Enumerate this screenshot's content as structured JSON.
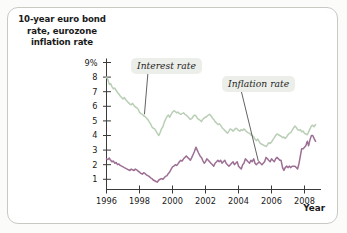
{
  "figure": {
    "title": "10-year euro bond rate, eurozone inflation rate",
    "title_line1": "10-year euro bond",
    "title_line2": "rate, eurozone",
    "title_line3": "inflation rate",
    "frame_color": "#c9c9c4",
    "background": "#ffffff"
  },
  "axes": {
    "x_axis_name": "Year",
    "y_ticks": [
      "9%",
      "8",
      "7",
      "6",
      "5",
      "4",
      "3",
      "2",
      "1"
    ],
    "x_ticks": [
      "1996",
      "1998",
      "2000",
      "2002",
      "2004",
      "2006",
      "2008"
    ]
  },
  "labels": {
    "interest": "Interest rate",
    "inflation": "Inflation rate"
  },
  "chart_data": {
    "type": "line",
    "title": "10-year euro bond rate, eurozone inflation rate",
    "xlabel": "Year",
    "ylabel": "Percent",
    "xlim": [
      1996.0,
      2009.0
    ],
    "ylim": [
      0.3,
      9.0
    ],
    "grid": false,
    "legend": "inline-annotations",
    "y_tick_values": [
      9,
      8,
      7,
      6,
      5,
      4,
      3,
      2,
      1
    ],
    "y_tick_labels": [
      "9%",
      "8",
      "7",
      "6",
      "5",
      "4",
      "3",
      "2",
      "1"
    ],
    "x_tick_values": [
      1996,
      1998,
      2000,
      2002,
      2004,
      2006,
      2008
    ],
    "x_tick_labels": [
      "1996",
      "1998",
      "2000",
      "2002",
      "2004",
      "2006",
      "2008"
    ],
    "annotations": [
      {
        "text": "Interest rate",
        "series": "10-year euro bond rate",
        "x": 1998.3,
        "y": 5.4
      },
      {
        "text": "Inflation rate",
        "series": "Eurozone inflation rate",
        "x": 2005.5,
        "y": 2.2
      }
    ],
    "series": [
      {
        "name": "10-year euro bond rate",
        "label": "Interest rate",
        "color": "#b9cfb5",
        "x": [
          1996.0,
          1996.08,
          1996.17,
          1996.25,
          1996.33,
          1996.42,
          1996.5,
          1996.58,
          1996.67,
          1996.75,
          1996.83,
          1996.92,
          1997.0,
          1997.08,
          1997.17,
          1997.25,
          1997.33,
          1997.42,
          1997.5,
          1997.58,
          1997.67,
          1997.75,
          1997.83,
          1997.92,
          1998.0,
          1998.08,
          1998.17,
          1998.25,
          1998.33,
          1998.42,
          1998.5,
          1998.58,
          1998.67,
          1998.75,
          1998.83,
          1998.92,
          1999.0,
          1999.08,
          1999.17,
          1999.25,
          1999.33,
          1999.42,
          1999.5,
          1999.58,
          1999.67,
          1999.75,
          1999.83,
          1999.92,
          2000.0,
          2000.08,
          2000.17,
          2000.25,
          2000.33,
          2000.42,
          2000.5,
          2000.58,
          2000.67,
          2000.75,
          2000.83,
          2000.92,
          2001.0,
          2001.08,
          2001.17,
          2001.25,
          2001.33,
          2001.42,
          2001.5,
          2001.58,
          2001.67,
          2001.75,
          2001.83,
          2001.92,
          2002.0,
          2002.08,
          2002.17,
          2002.25,
          2002.33,
          2002.42,
          2002.5,
          2002.58,
          2002.67,
          2002.75,
          2002.83,
          2002.92,
          2003.0,
          2003.08,
          2003.17,
          2003.25,
          2003.33,
          2003.42,
          2003.5,
          2003.58,
          2003.67,
          2003.75,
          2003.83,
          2003.92,
          2004.0,
          2004.08,
          2004.17,
          2004.25,
          2004.33,
          2004.42,
          2004.5,
          2004.58,
          2004.67,
          2004.75,
          2004.83,
          2004.92,
          2005.0,
          2005.08,
          2005.17,
          2005.25,
          2005.33,
          2005.42,
          2005.5,
          2005.58,
          2005.67,
          2005.75,
          2005.83,
          2005.92,
          2006.0,
          2006.08,
          2006.17,
          2006.25,
          2006.33,
          2006.42,
          2006.5,
          2006.58,
          2006.67,
          2006.75,
          2006.83,
          2006.92,
          2007.0,
          2007.08,
          2007.17,
          2007.25,
          2007.33,
          2007.42,
          2007.5,
          2007.58,
          2007.67,
          2007.75,
          2007.83,
          2007.92,
          2008.0,
          2008.08,
          2008.17,
          2008.25,
          2008.33,
          2008.42,
          2008.5,
          2008.58,
          2008.67
        ],
        "values": [
          8.0,
          7.85,
          7.5,
          7.55,
          7.35,
          7.2,
          7.25,
          7.1,
          6.95,
          6.85,
          6.7,
          6.6,
          6.5,
          6.6,
          6.45,
          6.35,
          6.25,
          6.15,
          6.1,
          6.2,
          6.05,
          5.95,
          5.9,
          5.8,
          5.6,
          5.5,
          5.45,
          5.35,
          5.3,
          5.2,
          5.1,
          4.95,
          4.8,
          4.6,
          4.5,
          4.45,
          4.3,
          4.15,
          4.0,
          4.2,
          4.45,
          4.6,
          4.9,
          5.1,
          5.3,
          5.4,
          5.25,
          5.45,
          5.6,
          5.7,
          5.65,
          5.55,
          5.6,
          5.5,
          5.45,
          5.5,
          5.55,
          5.45,
          5.4,
          5.3,
          5.2,
          5.1,
          5.15,
          5.3,
          5.4,
          5.35,
          5.2,
          5.1,
          5.05,
          4.95,
          5.1,
          5.2,
          5.25,
          5.3,
          5.4,
          5.45,
          5.35,
          5.2,
          5.1,
          4.95,
          4.85,
          4.75,
          4.8,
          4.7,
          4.55,
          4.45,
          4.35,
          4.25,
          4.15,
          4.3,
          4.45,
          4.4,
          4.3,
          4.4,
          4.5,
          4.45,
          4.35,
          4.3,
          4.4,
          4.35,
          4.45,
          4.35,
          4.25,
          4.2,
          4.15,
          4.05,
          4.0,
          3.9,
          3.75,
          3.65,
          3.75,
          3.6,
          3.45,
          3.4,
          3.35,
          3.3,
          3.25,
          3.35,
          3.5,
          3.45,
          3.55,
          3.7,
          3.85,
          4.0,
          4.1,
          4.05,
          4.0,
          3.95,
          3.85,
          3.9,
          3.8,
          3.9,
          4.05,
          4.15,
          4.2,
          4.35,
          4.5,
          4.65,
          4.55,
          4.4,
          4.35,
          4.4,
          4.25,
          4.3,
          4.15,
          4.1,
          4.05,
          4.25,
          4.45,
          4.65,
          4.7,
          4.6,
          4.75
        ]
      },
      {
        "name": "Eurozone inflation rate",
        "label": "Inflation rate",
        "color": "#9c6e93",
        "x": [
          1996.0,
          1996.08,
          1996.17,
          1996.25,
          1996.33,
          1996.42,
          1996.5,
          1996.58,
          1996.67,
          1996.75,
          1996.83,
          1996.92,
          1997.0,
          1997.08,
          1997.17,
          1997.25,
          1997.33,
          1997.42,
          1997.5,
          1997.58,
          1997.67,
          1997.75,
          1997.83,
          1997.92,
          1998.0,
          1998.08,
          1998.17,
          1998.25,
          1998.33,
          1998.42,
          1998.5,
          1998.58,
          1998.67,
          1998.75,
          1998.83,
          1998.92,
          1999.0,
          1999.08,
          1999.17,
          1999.25,
          1999.33,
          1999.42,
          1999.5,
          1999.58,
          1999.67,
          1999.75,
          1999.83,
          1999.92,
          2000.0,
          2000.08,
          2000.17,
          2000.25,
          2000.33,
          2000.42,
          2000.5,
          2000.58,
          2000.67,
          2000.75,
          2000.83,
          2000.92,
          2001.0,
          2001.08,
          2001.17,
          2001.25,
          2001.33,
          2001.42,
          2001.5,
          2001.58,
          2001.67,
          2001.75,
          2001.83,
          2001.92,
          2002.0,
          2002.08,
          2002.17,
          2002.25,
          2002.33,
          2002.42,
          2002.5,
          2002.58,
          2002.67,
          2002.75,
          2002.83,
          2002.92,
          2003.0,
          2003.08,
          2003.17,
          2003.25,
          2003.33,
          2003.42,
          2003.5,
          2003.58,
          2003.67,
          2003.75,
          2003.83,
          2003.92,
          2004.0,
          2004.08,
          2004.17,
          2004.25,
          2004.33,
          2004.42,
          2004.5,
          2004.58,
          2004.67,
          2004.75,
          2004.83,
          2004.92,
          2005.0,
          2005.08,
          2005.17,
          2005.25,
          2005.33,
          2005.42,
          2005.5,
          2005.58,
          2005.67,
          2005.75,
          2005.83,
          2005.92,
          2006.0,
          2006.08,
          2006.17,
          2006.25,
          2006.33,
          2006.42,
          2006.5,
          2006.58,
          2006.67,
          2006.75,
          2006.83,
          2006.92,
          2007.0,
          2007.08,
          2007.17,
          2007.25,
          2007.33,
          2007.42,
          2007.5,
          2007.58,
          2007.67,
          2007.75,
          2007.83,
          2007.92,
          2008.0,
          2008.08,
          2008.17,
          2008.25,
          2008.33,
          2008.42,
          2008.5,
          2008.58,
          2008.67
        ],
        "values": [
          2.4,
          2.35,
          2.45,
          2.3,
          2.2,
          2.25,
          2.1,
          2.15,
          2.0,
          2.05,
          1.95,
          1.9,
          1.85,
          1.8,
          1.75,
          1.7,
          1.65,
          1.6,
          1.7,
          1.65,
          1.6,
          1.7,
          1.65,
          1.55,
          1.5,
          1.4,
          1.35,
          1.45,
          1.4,
          1.3,
          1.25,
          1.2,
          1.1,
          1.05,
          0.95,
          0.9,
          0.85,
          0.8,
          0.95,
          1.0,
          1.05,
          1.0,
          1.1,
          1.2,
          1.25,
          1.4,
          1.5,
          1.7,
          1.85,
          1.9,
          2.0,
          1.95,
          2.05,
          2.2,
          2.3,
          2.25,
          2.4,
          2.5,
          2.6,
          2.5,
          2.4,
          2.3,
          2.5,
          2.7,
          2.9,
          3.2,
          3.0,
          2.8,
          2.6,
          2.5,
          2.3,
          2.1,
          2.2,
          2.4,
          2.3,
          2.2,
          2.1,
          2.0,
          1.9,
          2.1,
          2.2,
          2.3,
          2.2,
          2.3,
          2.1,
          2.2,
          2.3,
          2.1,
          2.0,
          1.9,
          2.0,
          2.1,
          2.2,
          2.0,
          2.1,
          2.2,
          1.9,
          1.8,
          1.7,
          2.0,
          2.1,
          2.4,
          2.3,
          2.2,
          2.1,
          2.3,
          2.2,
          2.4,
          2.1,
          2.0,
          2.1,
          2.2,
          2.1,
          2.0,
          2.1,
          2.2,
          2.5,
          2.4,
          2.3,
          2.2,
          2.4,
          2.3,
          2.2,
          2.4,
          2.5,
          2.4,
          2.3,
          2.3,
          1.8,
          1.6,
          1.8,
          1.9,
          1.8,
          1.9,
          1.8,
          1.9,
          1.9,
          1.9,
          1.8,
          1.7,
          2.1,
          2.6,
          3.1,
          3.1,
          3.2,
          3.3,
          3.6,
          3.3,
          3.7,
          4.0,
          4.0,
          3.8,
          3.6
        ]
      }
    ]
  }
}
